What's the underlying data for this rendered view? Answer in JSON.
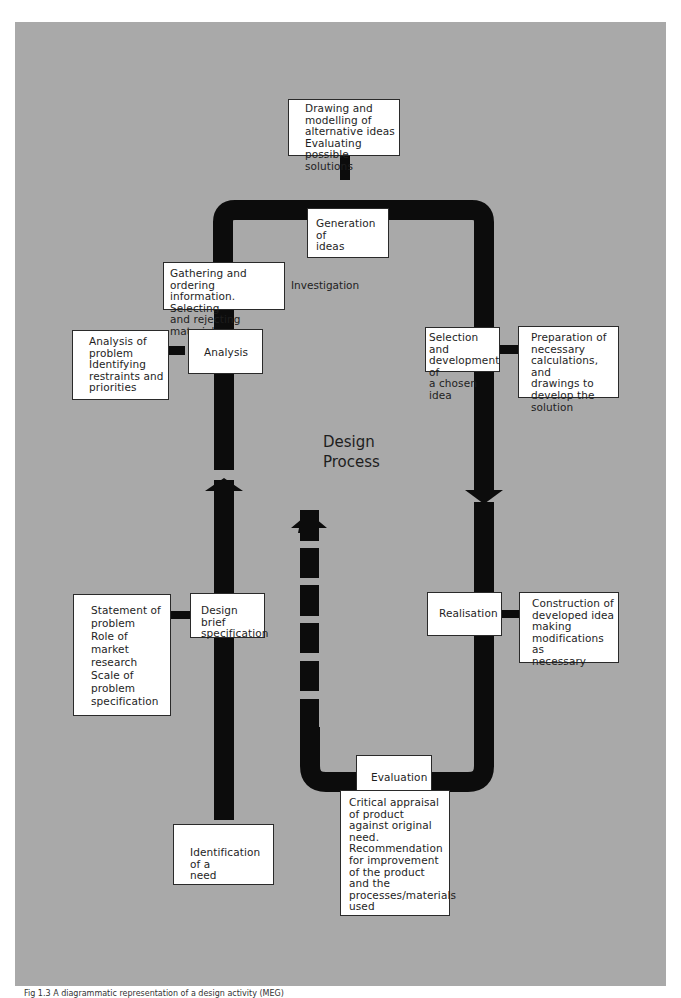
{
  "diagram": {
    "title": "Design\nProcess",
    "colors": {
      "background": "#a9a9a9",
      "flow": "#0c0c0c",
      "box": "#ffffff",
      "text": "#1e1e1e"
    },
    "stages": [
      {
        "id": "identification",
        "label": "Identification of a\nneed"
      },
      {
        "id": "design-brief",
        "label": "Design brief\nspecification"
      },
      {
        "id": "analysis",
        "label": "Analysis"
      },
      {
        "id": "investigation",
        "label": "Gathering and ordering\ninformation.  Selecting\nand rejecting material"
      },
      {
        "id": "generation",
        "label": "Generation of\nideas"
      },
      {
        "id": "selection",
        "label": "Selection and\ndevelopment of\na chosen idea"
      },
      {
        "id": "realisation",
        "label": "Realisation"
      },
      {
        "id": "evaluation",
        "label": "Evaluation"
      }
    ],
    "notes": {
      "design_brief": "Statement of\nproblem\nRole of\nmarket\nresearch\nScale of\nproblem\nspecification",
      "analysis": "Analysis of\nproblem\nIdentifying\nrestraints and\npriorities",
      "generation": "Drawing and\nmodelling of\nalternative ideas\nEvaluating\npossible\nsolutions",
      "selection": "Preparation of\nnecessary\ncalculations, and\ndrawings to\ndevelop the\nsolution",
      "realisation": "Construction of\ndeveloped idea\nmaking\nmodifications as\nnecessary",
      "evaluation": "Critical appraisal\nof product\nagainst original\nneed.\nRecommendation\nfor improvement\nof the product\nand the\nprocesses/materials\nused"
    },
    "side_label": "Investigation",
    "caption": "Fig 1.3 A diagrammatic representation of a design activity (MEG)"
  }
}
